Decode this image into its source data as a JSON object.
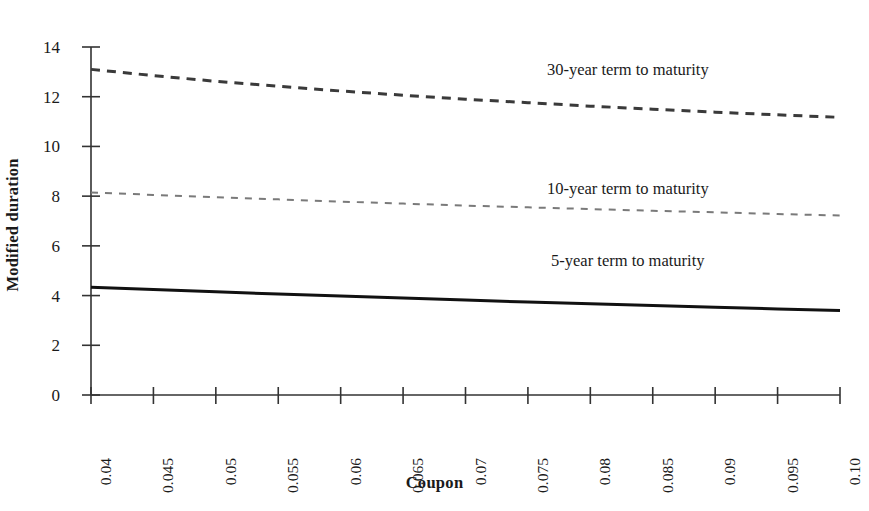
{
  "chart_data": {
    "type": "line",
    "title": "",
    "xlabel": "Coupon",
    "ylabel": "Modified duration",
    "x": [
      0.04,
      0.045,
      0.05,
      0.055,
      0.06,
      0.065,
      0.07,
      0.075,
      0.08,
      0.085,
      0.09,
      0.095,
      0.1
    ],
    "xtick_labels": [
      "0.04",
      "0.045",
      "0.05",
      "0.055",
      "0.06",
      "0.065",
      "0.07",
      "0.075",
      "0.08",
      "0.085",
      "0.09",
      "0.095",
      "0.10"
    ],
    "ytick_labels": [
      "0",
      "2",
      "4",
      "6",
      "8",
      "10",
      "12",
      "14"
    ],
    "yticks": [
      0,
      2,
      4,
      6,
      8,
      10,
      12,
      14
    ],
    "xlim": [
      0.04,
      0.1
    ],
    "ylim": [
      0,
      14
    ],
    "grid": false,
    "legend_position": "inline-annotations",
    "series": [
      {
        "name": "30-year term to maturity",
        "style": "dashed",
        "color": "#3a3a3a",
        "width": 3.0,
        "dash": "9,7",
        "values": [
          13.1,
          12.85,
          12.62,
          12.42,
          12.23,
          12.06,
          11.9,
          11.76,
          11.62,
          11.5,
          11.38,
          11.27,
          11.17
        ]
      },
      {
        "name": "10-year term to maturity",
        "style": "dashed",
        "color": "#7a7a7a",
        "width": 2.0,
        "dash": "7,7",
        "values": [
          8.15,
          8.05,
          7.96,
          7.87,
          7.78,
          7.7,
          7.62,
          7.55,
          7.48,
          7.41,
          7.35,
          7.28,
          7.22
        ]
      },
      {
        "name": "5-year term to maturity",
        "style": "solid",
        "color": "#111111",
        "width": 3.0,
        "dash": "",
        "values": [
          4.33,
          4.24,
          4.15,
          4.06,
          3.98,
          3.9,
          3.82,
          3.74,
          3.67,
          3.6,
          3.53,
          3.46,
          3.4
        ]
      }
    ],
    "annotations": [
      {
        "text": "30-year term to maturity",
        "x": 0.083,
        "y": 13.05
      },
      {
        "text": "10-year term to maturity",
        "x": 0.083,
        "y": 8.25
      },
      {
        "text": "5-year term to maturity",
        "x": 0.083,
        "y": 5.35
      }
    ]
  },
  "axis": {
    "x_title": "Coupon",
    "y_title": "Modified duration"
  }
}
